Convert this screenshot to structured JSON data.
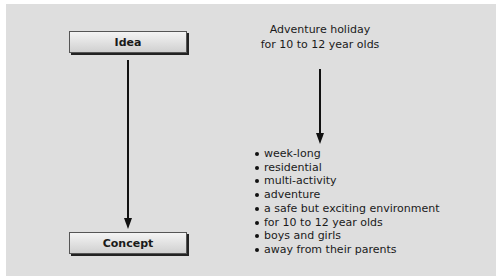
{
  "diagram": {
    "left": {
      "top_box": "Idea",
      "bottom_box": "Concept"
    },
    "right": {
      "title_line1": "Adventure holiday",
      "title_line2": "for 10 to 12 year olds",
      "items": [
        "week-long",
        "residential",
        "multi-activity",
        "adventure",
        "a safe but exciting environment",
        "for 10 to 12 year olds",
        "boys and girls",
        "away from their parents"
      ]
    }
  }
}
